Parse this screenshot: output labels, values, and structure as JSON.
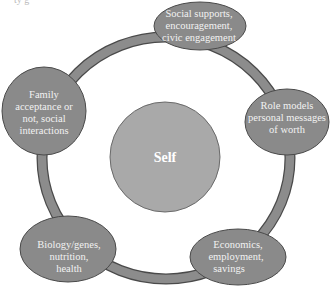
{
  "cropped_top_text": "ty g",
  "colors": {
    "background": "#ffffff",
    "ring": "#8c8c8c",
    "outline": "#4a4a4a",
    "outer_node": "#8a8a8a",
    "center_node": "#a9a9a9",
    "text": "#f2f2f2"
  },
  "center": {
    "label": "Self"
  },
  "nodes": [
    {
      "id": "social",
      "lines": [
        "Social supports,",
        "encouragement,",
        "civic engagement"
      ]
    },
    {
      "id": "role-models",
      "lines": [
        "Role models",
        "personal messages",
        "of worth"
      ]
    },
    {
      "id": "economics",
      "lines": [
        "Economics,",
        "employment,",
        "savings"
      ]
    },
    {
      "id": "biology",
      "lines": [
        "Biology/genes,",
        "nutrition,",
        "health"
      ]
    },
    {
      "id": "family",
      "lines": [
        "Family",
        "acceptance or",
        "not, social",
        "interactions"
      ]
    }
  ]
}
